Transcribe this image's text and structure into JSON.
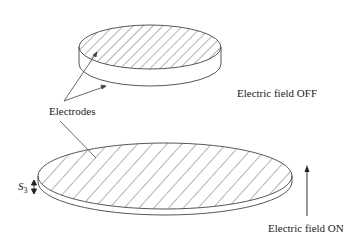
{
  "diagram": {
    "labels": {
      "electrodes": "Electrodes",
      "field_off": "Electric field OFF",
      "field_on": "Electric field ON",
      "thickness_symbol": "S",
      "thickness_subscript": "3"
    },
    "colors": {
      "stroke": "#444444",
      "background": "#ffffff",
      "text": "#222222"
    },
    "shapes": {
      "top_disk": {
        "cx": 150,
        "cy": 47,
        "rx": 71,
        "ry": 22,
        "thickness": 17,
        "hatched_top": true
      },
      "bottom_disk": {
        "cx": 165,
        "cy": 176,
        "rx": 127,
        "ry": 33,
        "thickness": 6,
        "hatched_top": true
      },
      "field_arrow": {
        "x": 307,
        "y_start": 216,
        "y_end": 166,
        "direction": "up"
      }
    }
  }
}
